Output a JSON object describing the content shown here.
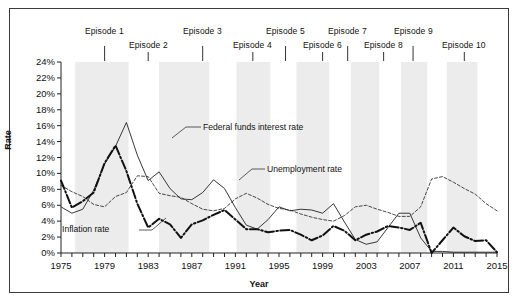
{
  "figure": {
    "width": 518,
    "height": 302,
    "background": "#ffffff",
    "border_color": "#3a3a3a"
  },
  "axis": {
    "y_title": "Rate",
    "x_title": "Year"
  },
  "annotations": {
    "federal_funds": "Federal funds interest rate",
    "unemployment": "Unemployment rate",
    "inflation": "Inflation rate"
  },
  "episodes": [
    {
      "label": "Episode 1",
      "year": 1979.0,
      "row": 0
    },
    {
      "label": "Episode 2",
      "year": 1983.0,
      "row": 1
    },
    {
      "label": "Episode 3",
      "year": 1988.0,
      "row": 0
    },
    {
      "label": "Episode 4",
      "year": 1992.6,
      "row": 1
    },
    {
      "label": "Episode 5",
      "year": 1995.6,
      "row": 0
    },
    {
      "label": "Episode 6",
      "year": 1999.0,
      "row": 1
    },
    {
      "label": "Episode 7",
      "year": 2001.3,
      "row": 0
    },
    {
      "label": "Episode 8",
      "year": 2004.6,
      "row": 1
    },
    {
      "label": "Episode 9",
      "year": 2007.3,
      "row": 0
    },
    {
      "label": "Episode 10",
      "year": 2012.0,
      "row": 1
    }
  ],
  "bands": [
    {
      "start": 1976.3,
      "end": 1981.2
    },
    {
      "start": 1984.0,
      "end": 1988.6
    },
    {
      "start": 1991.1,
      "end": 1994.2
    },
    {
      "start": 1996.6,
      "end": 1999.6
    },
    {
      "start": 2001.6,
      "end": 2004.2
    },
    {
      "start": 2006.2,
      "end": 2008.6
    },
    {
      "start": 2010.4,
      "end": 2013.2
    }
  ],
  "chart_data": {
    "type": "line",
    "title": "",
    "xlabel": "Year",
    "ylabel": "Rate",
    "xlim": [
      1975,
      2015
    ],
    "ylim": [
      0,
      24
    ],
    "y_ticks": [
      "0%",
      "2%",
      "4%",
      "6%",
      "8%",
      "10%",
      "12%",
      "14%",
      "16%",
      "18%",
      "20%",
      "22%",
      "24%"
    ],
    "y_tick_values": [
      0,
      2,
      4,
      6,
      8,
      10,
      12,
      14,
      16,
      18,
      20,
      22,
      24
    ],
    "x_tick_labels": [
      "1975",
      "1979",
      "1983",
      "1987",
      "1991",
      "1995",
      "1999",
      "2003",
      "2007",
      "2011",
      "2015"
    ],
    "x_tick_values": [
      1975,
      1979,
      1983,
      1987,
      1991,
      1995,
      1999,
      2003,
      2007,
      2011,
      2015
    ],
    "x_minor_step": 1,
    "grid": false,
    "legend": "inline-annotations",
    "x": [
      1975,
      1976,
      1977,
      1978,
      1979,
      1980,
      1981,
      1982,
      1983,
      1984,
      1985,
      1986,
      1987,
      1988,
      1989,
      1990,
      1991,
      1992,
      1993,
      1994,
      1995,
      1996,
      1997,
      1998,
      1999,
      2000,
      2001,
      2002,
      2003,
      2004,
      2005,
      2006,
      2007,
      2008,
      2009,
      2010,
      2011,
      2012,
      2013,
      2014,
      2015
    ],
    "series": [
      {
        "name": "Federal funds interest rate",
        "style": "thin-solid",
        "color": "#222222",
        "values": [
          5.8,
          5.0,
          5.5,
          7.9,
          11.2,
          13.4,
          16.4,
          12.3,
          9.1,
          10.2,
          8.1,
          6.8,
          6.7,
          7.6,
          9.2,
          8.1,
          5.7,
          3.5,
          3.0,
          4.2,
          5.8,
          5.3,
          5.5,
          5.4,
          5.0,
          6.2,
          3.9,
          1.7,
          1.1,
          1.4,
          3.2,
          5.0,
          5.0,
          1.9,
          0.2,
          0.2,
          0.1,
          0.1,
          0.1,
          0.1,
          0.1
        ]
      },
      {
        "name": "Unemployment rate",
        "style": "dashed",
        "color": "#333333",
        "values": [
          8.5,
          7.7,
          7.1,
          6.1,
          5.8,
          7.1,
          7.6,
          9.7,
          9.6,
          7.5,
          7.2,
          7.0,
          6.2,
          5.5,
          5.3,
          5.6,
          6.8,
          7.5,
          6.9,
          6.1,
          5.6,
          5.4,
          4.9,
          4.5,
          4.2,
          4.0,
          4.7,
          5.8,
          6.0,
          5.5,
          5.1,
          4.6,
          4.6,
          5.8,
          9.3,
          9.6,
          8.9,
          8.1,
          7.4,
          6.2,
          5.3
        ]
      },
      {
        "name": "Inflation rate",
        "style": "thick-dashdot",
        "color": "#111111",
        "values": [
          9.1,
          5.7,
          6.5,
          7.6,
          11.3,
          13.5,
          10.3,
          6.2,
          3.2,
          4.3,
          3.6,
          1.9,
          3.6,
          4.1,
          4.8,
          5.4,
          4.2,
          3.0,
          3.0,
          2.6,
          2.8,
          2.9,
          2.3,
          1.6,
          2.2,
          3.4,
          2.8,
          1.6,
          2.3,
          2.7,
          3.4,
          3.2,
          2.9,
          3.8,
          -0.4,
          1.6,
          3.2,
          2.1,
          1.5,
          1.6,
          0.1
        ]
      }
    ]
  }
}
